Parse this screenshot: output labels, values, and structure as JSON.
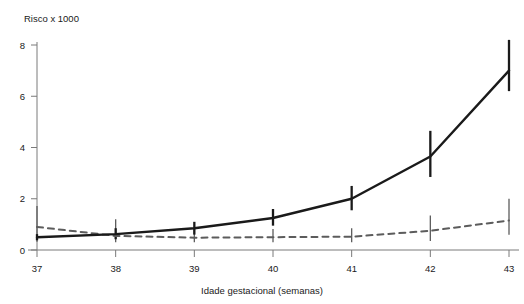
{
  "chart_data": {
    "type": "line",
    "title": "",
    "ylabel": "Risco x 1000",
    "xlabel": "Idade gestacional (semanas)",
    "x": [
      37,
      38,
      39,
      40,
      41,
      42,
      43
    ],
    "categories": [
      "37",
      "38",
      "39",
      "40",
      "41",
      "42",
      "43"
    ],
    "xlim": [
      36.7,
      43.35
    ],
    "ylim": [
      0,
      8.6
    ],
    "xticks": [
      37,
      38,
      39,
      40,
      41,
      42,
      43
    ],
    "xtick_labels": [
      "37",
      "38",
      "39",
      "40",
      "41",
      "42",
      "43"
    ],
    "yticks": [
      0,
      2,
      4,
      6,
      8
    ],
    "ytick_labels": [
      "0",
      "2",
      "4",
      "6",
      "8"
    ],
    "grid": false,
    "legend": "none",
    "series": [
      {
        "name": "solid-series",
        "style": "solid",
        "color": "#1a1a1a",
        "values": [
          0.5,
          0.62,
          0.85,
          1.25,
          2.0,
          3.65,
          7.0
        ],
        "error_low": [
          0.38,
          0.42,
          0.6,
          0.95,
          1.55,
          2.85,
          6.2
        ],
        "error_high": [
          0.62,
          0.85,
          1.1,
          1.6,
          2.5,
          4.65,
          8.2
        ]
      },
      {
        "name": "dashed-series",
        "style": "dashed",
        "color": "#5c5c5c",
        "values": [
          0.9,
          0.55,
          0.48,
          0.5,
          0.52,
          0.75,
          1.15
        ],
        "error_low": [
          0.32,
          0.3,
          0.3,
          0.3,
          0.3,
          0.35,
          0.6
        ],
        "error_high": [
          1.72,
          1.2,
          0.85,
          0.82,
          0.85,
          1.35,
          2.0
        ]
      }
    ]
  },
  "labels": {
    "ylabel": "Risco x 1000",
    "xlabel": "Idade gestacional (semanas)"
  }
}
